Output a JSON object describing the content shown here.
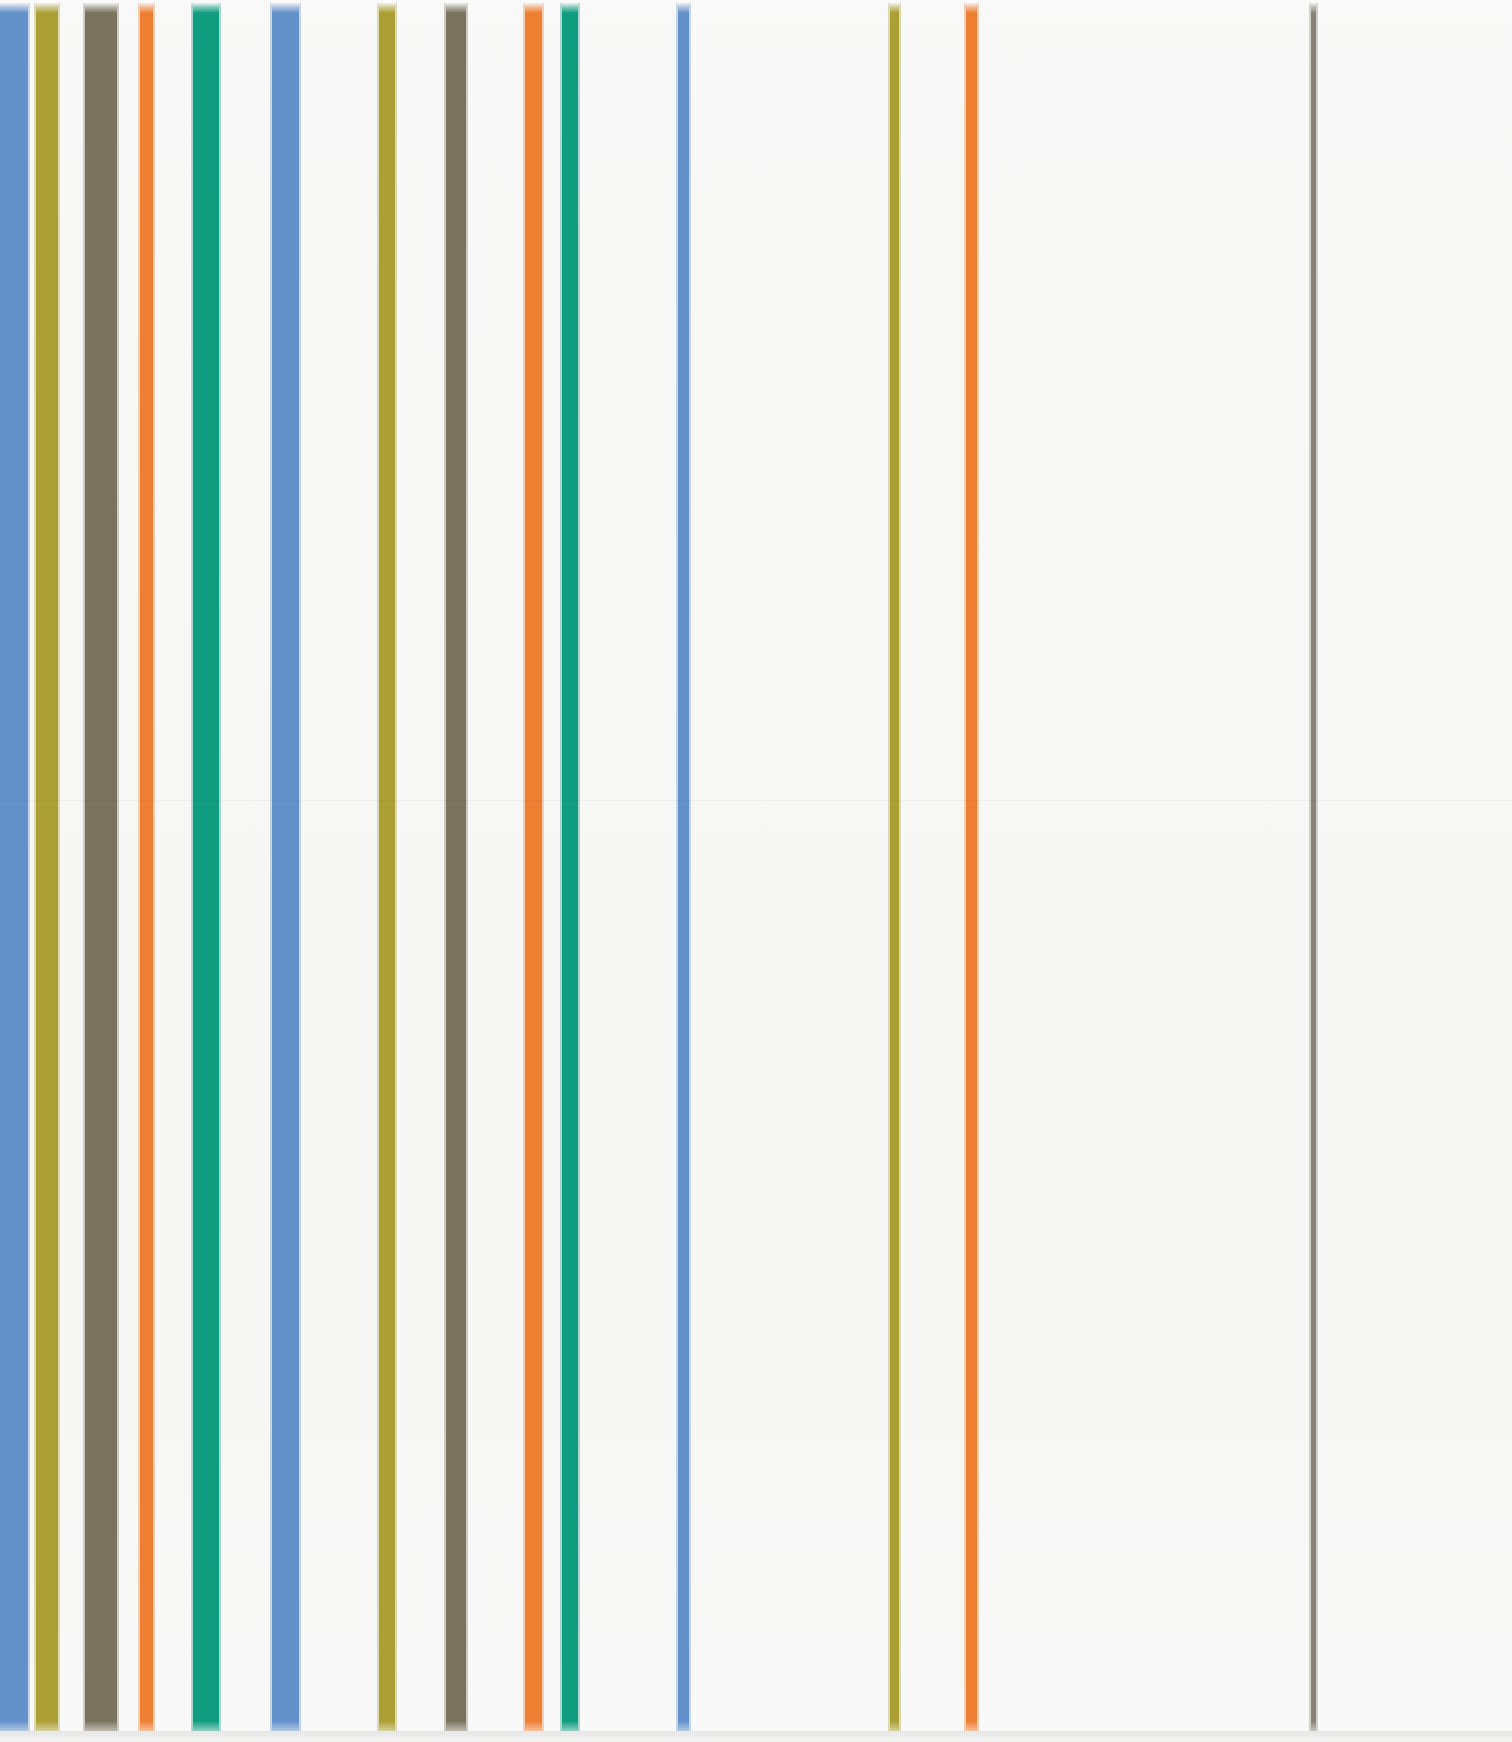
{
  "artwork": {
    "title": "Vertical Stripe Composition",
    "medium": "Acrylic on canvas (scanned reproduction)",
    "orientation": "portrait",
    "canvas_width_px": 1512,
    "canvas_height_px": 1742,
    "background_color": "#fdfdfc",
    "stripe_top_px": 3,
    "stripe_bottom_px": 1731,
    "scan_seam_y_px": 800
  },
  "palette": {
    "cornflower_blue": "#6595cf",
    "olive_gold": "#b0a335",
    "dark_olive_gray": "#7d7760",
    "orange": "#f58233",
    "teal_green": "#11a183",
    "warm_gray": "#8a8778",
    "paper_white": "#ffffff"
  },
  "chart_data": {
    "type": "bar",
    "subtitle": "Stripe widths and positions measured in pixels",
    "xlabel": "Horizontal position (px)",
    "ylabel": "",
    "xlim": [
      0,
      1512
    ],
    "ylim": [
      0,
      1742
    ],
    "grid": false,
    "legend_position": "none",
    "categories": [
      "stripe-01",
      "stripe-02",
      "stripe-03",
      "stripe-04",
      "stripe-05",
      "stripe-06",
      "stripe-07",
      "stripe-08",
      "stripe-09",
      "stripe-10",
      "stripe-11",
      "stripe-12",
      "stripe-13",
      "stripe-14"
    ],
    "values": [
      28,
      22,
      32,
      13,
      26,
      27,
      16,
      20,
      17,
      16,
      11,
      9,
      11,
      5
    ],
    "series": [
      {
        "name": "stripe_left_edge_px",
        "values": [
          0,
          36,
          85,
          140,
          193,
          272,
          379,
          446,
          525,
          562,
          678,
          890,
          966,
          1311
        ]
      },
      {
        "name": "stripe_width_px",
        "values": [
          28,
          22,
          32,
          13,
          26,
          27,
          16,
          20,
          17,
          16,
          11,
          9,
          11,
          5
        ]
      }
    ],
    "annotations": [
      "Leftmost cornflower-blue band is cropped by the canvas edge",
      "Stripe density decreases progressively toward the right",
      "A lone thin warm-gray line terminates the sequence at the right"
    ]
  },
  "stripes": [
    {
      "id": "stripe-01",
      "name": "stripe-cornflower-blue-1",
      "color_name": "cornflower_blue",
      "color": "#6595cf",
      "x": 0,
      "width": 28
    },
    {
      "id": "stripe-02",
      "name": "stripe-olive-gold-1",
      "color_name": "olive_gold",
      "color": "#b0a335",
      "x": 36,
      "width": 22
    },
    {
      "id": "stripe-03",
      "name": "stripe-dark-olive-1",
      "color_name": "dark_olive_gray",
      "color": "#7d7760",
      "x": 85,
      "width": 32
    },
    {
      "id": "stripe-04",
      "name": "stripe-orange-1",
      "color_name": "orange",
      "color": "#f58233",
      "x": 140,
      "width": 13
    },
    {
      "id": "stripe-05",
      "name": "stripe-teal-green-1",
      "color_name": "teal_green",
      "color": "#11a183",
      "x": 193,
      "width": 26
    },
    {
      "id": "stripe-06",
      "name": "stripe-cornflower-blue-2",
      "color_name": "cornflower_blue",
      "color": "#6595cf",
      "x": 272,
      "width": 27
    },
    {
      "id": "stripe-07",
      "name": "stripe-olive-gold-2",
      "color_name": "olive_gold",
      "color": "#b0a335",
      "x": 379,
      "width": 16
    },
    {
      "id": "stripe-08",
      "name": "stripe-dark-olive-2",
      "color_name": "dark_olive_gray",
      "color": "#7d7760",
      "x": 446,
      "width": 20
    },
    {
      "id": "stripe-09",
      "name": "stripe-orange-2",
      "color_name": "orange",
      "color": "#f58233",
      "x": 525,
      "width": 17
    },
    {
      "id": "stripe-10",
      "name": "stripe-teal-green-2",
      "color_name": "teal_green",
      "color": "#11a183",
      "x": 562,
      "width": 16
    },
    {
      "id": "stripe-11",
      "name": "stripe-cornflower-blue-3",
      "color_name": "cornflower_blue",
      "color": "#6595cf",
      "x": 678,
      "width": 11
    },
    {
      "id": "stripe-12",
      "name": "stripe-olive-gold-3",
      "color_name": "olive_gold",
      "color": "#b0a335",
      "x": 890,
      "width": 9
    },
    {
      "id": "stripe-13",
      "name": "stripe-orange-3",
      "color_name": "orange",
      "color": "#f58233",
      "x": 966,
      "width": 11
    },
    {
      "id": "stripe-14",
      "name": "stripe-warm-gray-1",
      "color_name": "warm_gray",
      "color": "#8a8778",
      "x": 1311,
      "width": 5
    }
  ]
}
